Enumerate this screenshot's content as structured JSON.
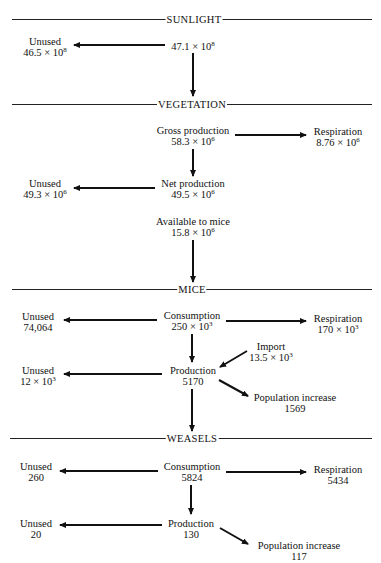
{
  "sections": {
    "sunlight": "SUNLIGHT",
    "vegetation": "VEGETATION",
    "mice": "MICE",
    "weasels": "WEASELS"
  },
  "sunlight": {
    "input": {
      "mantissa": "47.1 × 10",
      "exp": "8"
    },
    "unused": {
      "label": "Unused",
      "mantissa": "46.5 × 10",
      "exp": "8"
    }
  },
  "vegetation": {
    "gross": {
      "label": "Gross production",
      "mantissa": "58.3 × 10",
      "exp": "6"
    },
    "respiration": {
      "label": "Respiration",
      "mantissa": "8.76 × 10",
      "exp": "6"
    },
    "net": {
      "label": "Net production",
      "mantissa": "49.5 × 10",
      "exp": "6"
    },
    "unused": {
      "label": "Unused",
      "mantissa": "49.3 × 10",
      "exp": "6"
    },
    "available": {
      "label": "Available to mice",
      "mantissa": "15.8 × 10",
      "exp": "6"
    }
  },
  "mice": {
    "consumption": {
      "label": "Consumption",
      "mantissa": "250 × 10",
      "exp": "3"
    },
    "unused1": {
      "label": "Unused",
      "value": "74,064"
    },
    "respiration": {
      "label": "Respiration",
      "mantissa": "170 × 10",
      "exp": "3"
    },
    "import": {
      "label": "Import",
      "mantissa": "13.5 × 10",
      "exp": "3"
    },
    "production": {
      "label": "Production",
      "value": "5170"
    },
    "unused2": {
      "label": "Unused",
      "mantissa": "12 × 10",
      "exp": "3"
    },
    "population": {
      "label": "Population increase",
      "value": "1569"
    }
  },
  "weasels": {
    "consumption": {
      "label": "Consumption",
      "value": "5824"
    },
    "unused1": {
      "label": "Unused",
      "value": "260"
    },
    "respiration": {
      "label": "Respiration",
      "value": "5434"
    },
    "production": {
      "label": "Production",
      "value": "130"
    },
    "unused2": {
      "label": "Unused",
      "value": "20"
    },
    "population": {
      "label": "Population increase",
      "value": "117"
    }
  }
}
